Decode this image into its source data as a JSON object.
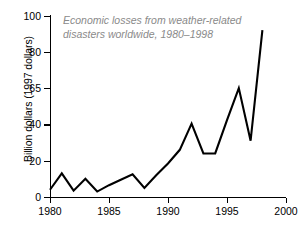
{
  "chart_data": {
    "type": "line",
    "title": "Economic losses from weather-related disasters worldwide, 1980–1998",
    "title_line1": "Economic losses from weather-related",
    "title_line2": "disasters worldwide, 1980–1998",
    "xlabel": "",
    "ylabel": "Billion dollars (1997 dollars)",
    "xlim": [
      1980,
      2000
    ],
    "ylim": [
      0,
      100
    ],
    "grid": false,
    "legend": "none",
    "line_color": "#000000",
    "title_color": "#8a8a8a",
    "axis_color": "#000000",
    "x_ticks": [
      1980,
      1985,
      1990,
      1995,
      2000
    ],
    "x_tick_labels": [
      "1980",
      "1985",
      "1990",
      "1995",
      "2000"
    ],
    "y_ticks": [
      0,
      20,
      40,
      65,
      80,
      100
    ],
    "y_tick_labels": [
      "0",
      "20",
      "40",
      "65",
      "80",
      "100"
    ],
    "x": [
      1980,
      1981,
      1982,
      1983,
      1984,
      1985,
      1986,
      1987,
      1988,
      1989,
      1990,
      1991,
      1992,
      1993,
      1994,
      1995,
      1996,
      1997,
      1998
    ],
    "values": [
      4,
      13,
      3.5,
      10,
      3,
      6.5,
      9.5,
      12.5,
      5,
      12,
      18.5,
      26,
      40.5,
      24,
      24,
      43,
      65,
      31,
      92
    ],
    "series": [
      {
        "name": "Economic losses",
        "values": [
          4,
          13,
          3.5,
          10,
          3,
          6.5,
          9.5,
          12.5,
          5,
          12,
          18.5,
          26,
          40.5,
          24,
          24,
          43,
          65,
          31,
          92
        ]
      }
    ]
  }
}
